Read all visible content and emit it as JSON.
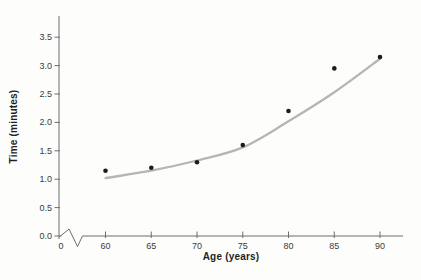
{
  "window": {
    "background": "#fdfdfc"
  },
  "chart_data": {
    "type": "scatter",
    "title": "",
    "xlabel": "Age (years)",
    "ylabel": "Time (minutes)",
    "grid": false,
    "legend": null,
    "x_axis": {
      "origin_label": "0",
      "has_break_symbol": true,
      "tick_values": [
        60,
        65,
        70,
        75,
        80,
        85,
        90
      ],
      "tick_labels": [
        "60",
        "65",
        "70",
        "75",
        "80",
        "85",
        "90"
      ],
      "range_shown": [
        60,
        92.5
      ]
    },
    "y_axis": {
      "tick_values": [
        0,
        0.5,
        1,
        1.5,
        2,
        2.5,
        3,
        3.5
      ],
      "tick_labels": [
        "0.0",
        "0.5",
        "1.0",
        "1.5",
        "2.0",
        "2.5",
        "3.0",
        "3.5"
      ],
      "range_shown": [
        0,
        3.85
      ]
    },
    "series": [
      {
        "name": "observed-points",
        "kind": "scatter",
        "x": [
          60,
          65,
          70,
          75,
          80,
          85,
          90
        ],
        "y": [
          1.15,
          1.2,
          1.3,
          1.6,
          2.2,
          2.95,
          3.15
        ]
      },
      {
        "name": "fitted-curve",
        "kind": "smooth-line",
        "x": [
          60,
          65,
          70,
          75,
          80,
          85,
          90
        ],
        "y": [
          1.02,
          1.15,
          1.33,
          1.56,
          2.02,
          2.53,
          3.12
        ]
      }
    ],
    "colors": {
      "point": "#1c1c1c",
      "curve": "#b5b5b5",
      "axis": "#6e6e6e",
      "tick_label": "#3b3b3b",
      "axis_title": "#1f1f1f"
    }
  }
}
